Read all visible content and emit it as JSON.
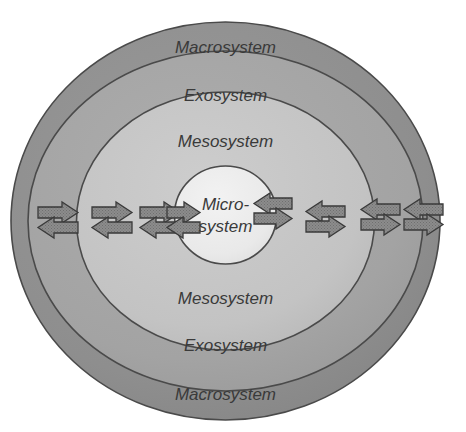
{
  "diagram": {
    "type": "concentric-rings",
    "canvas": {
      "width": 466,
      "height": 432
    },
    "background_color": "#ffffff",
    "stroke_color": "#4a4a4a",
    "text_color": "#3a3a3a",
    "rings": [
      {
        "id": "macrosystem",
        "label": "Macrosystem",
        "level": 4,
        "color": "#8e8e8e",
        "cx": 225.5,
        "cy": 221,
        "rx": 214.5,
        "ry": 199,
        "label_top_y": 49,
        "label_bottom_y": 396
      },
      {
        "id": "exosystem",
        "label": "Exosystem",
        "level": 3,
        "color": "#a3a3a3",
        "cx": 225.5,
        "cy": 221,
        "rx": 197.5,
        "ry": 170,
        "label_top_y": 97,
        "label_bottom_y": 347
      },
      {
        "id": "mesosystem",
        "label": "Mesosystem",
        "level": 2,
        "color": "#c3c3c3",
        "cx": 225.5,
        "cy": 221,
        "rx": 149,
        "ry": 129,
        "label_top_y": 143,
        "label_bottom_y": 300
      },
      {
        "id": "microsystem",
        "label": "Micro-system",
        "level": 1,
        "color": "#e9e9e9",
        "cx": 225.5,
        "cy": 215,
        "rx": 51,
        "ry": 49,
        "label_line1": "Micro-",
        "label_line2": "system",
        "label_line1_y": 210,
        "label_line2_y": 232
      }
    ],
    "arrow_style": {
      "fill": "#8c8c8c",
      "stroke": "#3a3a3a",
      "texture": "dotted",
      "description": "bidirectional influence arrows crossing every ring boundary"
    },
    "arrow_pairs": [
      {
        "id": "arrow-pair-left-4",
        "side": "left",
        "boundary": "macrosystem-outer",
        "x": 60,
        "top_direction": "right",
        "bottom_direction": "left"
      },
      {
        "id": "arrow-pair-left-3",
        "side": "left",
        "boundary": "macrosystem-exosystem",
        "x": 112,
        "top_direction": "right",
        "bottom_direction": "left"
      },
      {
        "id": "arrow-pair-left-2",
        "side": "left",
        "boundary": "exosystem-mesosystem",
        "x": 160,
        "top_direction": "right",
        "bottom_direction": "left"
      },
      {
        "id": "arrow-pair-left-1",
        "side": "left",
        "boundary": "mesosystem-microsystem",
        "x": 187,
        "top_direction": "right",
        "bottom_direction": "left"
      },
      {
        "id": "arrow-pair-right-1",
        "side": "right",
        "boundary": "microsystem-mesosystem",
        "x": 268,
        "top_direction": "left",
        "bottom_direction": "right"
      },
      {
        "id": "arrow-pair-right-2",
        "side": "right",
        "boundary": "mesosystem-exosystem",
        "x": 322,
        "top_direction": "left",
        "bottom_direction": "right"
      },
      {
        "id": "arrow-pair-right-3",
        "side": "right",
        "boundary": "exosystem-macrosystem",
        "x": 377,
        "top_direction": "left",
        "bottom_direction": "right"
      },
      {
        "id": "arrow-pair-right-4",
        "side": "right",
        "boundary": "macrosystem-outer",
        "x": 420,
        "top_direction": "left",
        "bottom_direction": "right"
      }
    ]
  }
}
